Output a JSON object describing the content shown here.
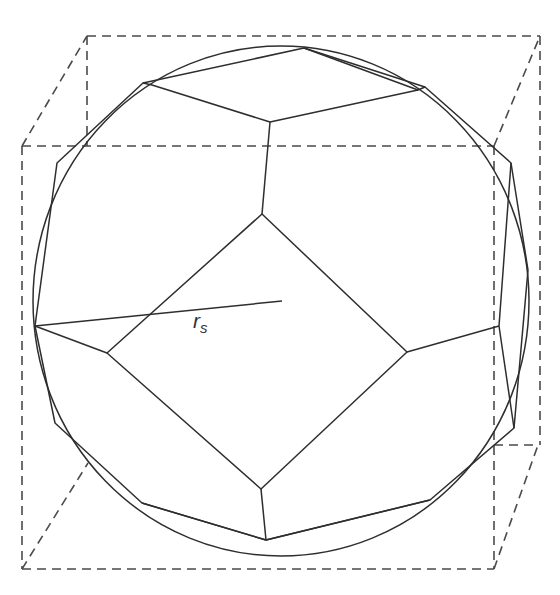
{
  "figure": {
    "radius_label": {
      "main": "r",
      "sub": "s"
    },
    "colors": {
      "line": "#2e2e2e",
      "dash": "#4a4a4a",
      "background": "#ffffff"
    }
  }
}
